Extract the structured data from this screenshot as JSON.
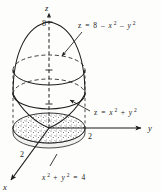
{
  "figure": {
    "background_color": "#fdfdfc",
    "ink_color": "#1a1a1a"
  },
  "axes": {
    "z": {
      "label": "z",
      "direction": "up",
      "style": "dashed"
    },
    "y": {
      "label": "y",
      "direction": "right",
      "style": "solid"
    },
    "x": {
      "label": "x",
      "direction": "down-left",
      "style": "solid"
    }
  },
  "ticks": [
    {
      "name": "z-tick-8",
      "value": "8",
      "axis": "z"
    },
    {
      "name": "y-tick-2",
      "value": "2",
      "axis": "y"
    },
    {
      "name": "x-tick-2",
      "value": "2",
      "axis": "x"
    }
  ],
  "labels": {
    "paraboloid": {
      "lhs": "z",
      "eq": "=",
      "rhs_const": "8",
      "minus1": "–",
      "term_x": "x",
      "term_x_pow": "2",
      "minus2": "–",
      "term_y": "y",
      "term_y_pow": "2",
      "full": "z = 8 – x² – y²"
    },
    "cone": {
      "lhs": "z",
      "eq": "=",
      "term_x": "x",
      "term_x_pow": "2",
      "plus": "+",
      "term_y": "y",
      "term_y_pow": "2",
      "full": "z = x² + y²"
    },
    "base_circle": {
      "term_x": "x",
      "term_x_pow": "2",
      "plus": "+",
      "term_y": "y",
      "term_y_pow": "2",
      "eq": "=",
      "rhs": "4",
      "full": "x² + y² = 4"
    }
  },
  "surfaces": [
    {
      "name": "paraboloid-dome",
      "equation": "z = 8 - x^2 - y^2",
      "apex_z": 8
    },
    {
      "name": "cone-surface",
      "equation": "z = x^2 + y^2",
      "vertex": "origin"
    },
    {
      "name": "intersection-ellipse",
      "style": "dashed",
      "radius": 2
    },
    {
      "name": "projection-disk",
      "fill": "stipple",
      "equation": "x^2 + y^2 = 4",
      "radius": 2
    }
  ]
}
